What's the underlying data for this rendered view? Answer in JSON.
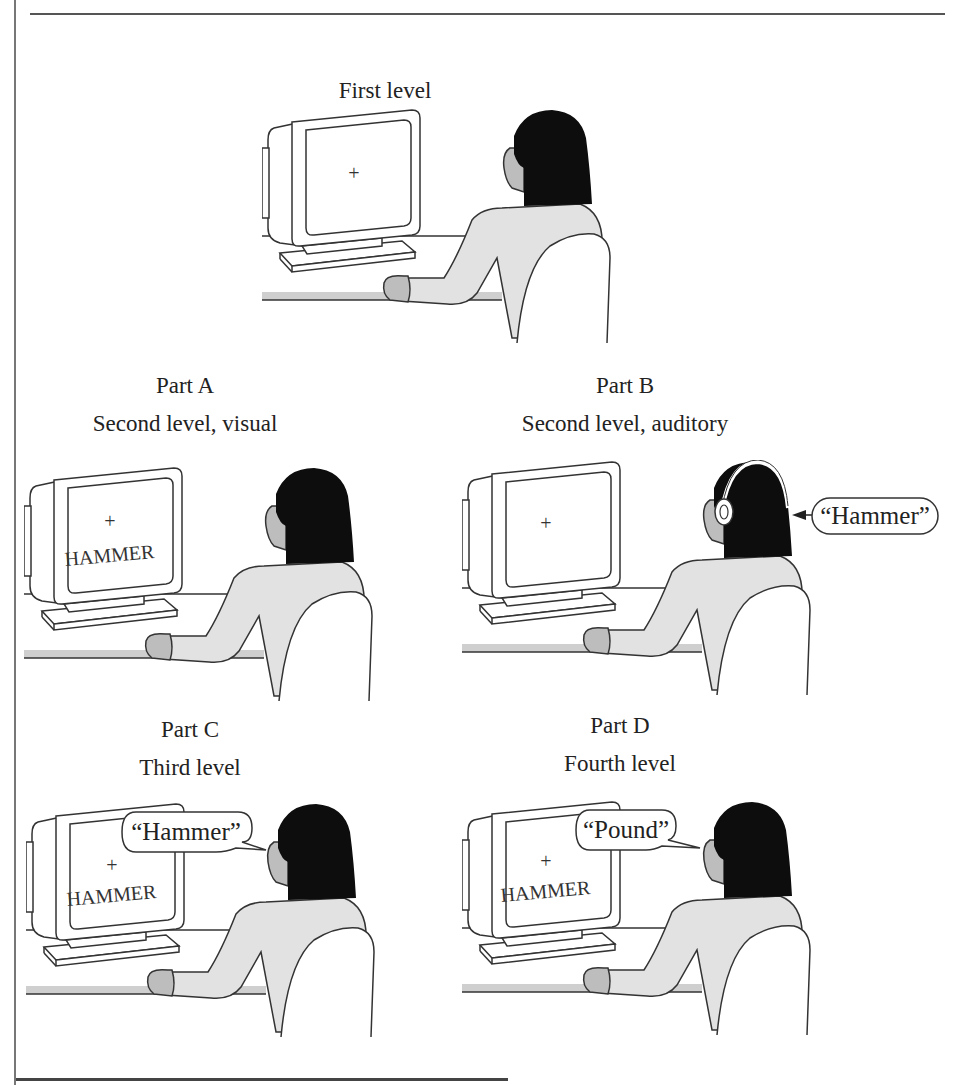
{
  "figure": {
    "panels": [
      {
        "id": "first-level",
        "captions": [
          "First level"
        ],
        "screen": {
          "fixation": "+",
          "word": ""
        },
        "headphones": false,
        "speech": null,
        "audio_input": null
      },
      {
        "id": "part-a",
        "captions": [
          "Part A",
          "Second level, visual"
        ],
        "screen": {
          "fixation": "+",
          "word": "HAMMER"
        },
        "headphones": false,
        "speech": null,
        "audio_input": null
      },
      {
        "id": "part-b",
        "captions": [
          "Part B",
          "Second level, auditory"
        ],
        "screen": {
          "fixation": "+",
          "word": ""
        },
        "headphones": true,
        "speech": null,
        "audio_input": "“Hammer”"
      },
      {
        "id": "part-c",
        "captions": [
          "Part C",
          "Third level"
        ],
        "screen": {
          "fixation": "+",
          "word": "HAMMER"
        },
        "headphones": false,
        "speech": "“Hammer”",
        "audio_input": null
      },
      {
        "id": "part-d",
        "captions": [
          "Part D",
          "Fourth level"
        ],
        "screen": {
          "fixation": "+",
          "word": "HAMMER"
        },
        "headphones": false,
        "speech": "“Pound”",
        "audio_input": null
      }
    ],
    "colors": {
      "outline": "#333333",
      "hair": "#0d0d0d",
      "skin": "#bdbdbd",
      "shirt": "#e2e2e2",
      "desk_edge": "#cfcfcf",
      "background": "#ffffff"
    }
  }
}
